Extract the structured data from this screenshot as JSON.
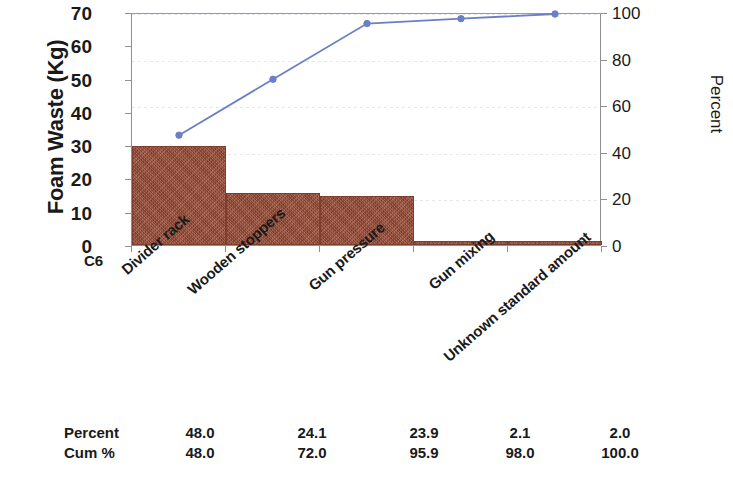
{
  "chart_data": {
    "type": "bar",
    "title": "",
    "subtitle": "",
    "categories": [
      "Divider rack",
      "Wooden stoppers",
      "Gun pressure",
      "Gun mixing",
      "Unknown standard amount"
    ],
    "series": [
      {
        "name": "Foam Waste (Kg)",
        "type": "bar",
        "values": [
          29.8,
          15.5,
          14.8,
          1.3,
          1.2
        ],
        "axis": "left",
        "color": "#9a4f3a"
      },
      {
        "name": "Cum %",
        "type": "line",
        "values": [
          48.0,
          72.0,
          95.9,
          98.0,
          100.0
        ],
        "axis": "right",
        "color": "#6b7fc7"
      }
    ],
    "xlabel": "C6",
    "ylabel": "Foam Waste (Kg)",
    "y2label": "Percent",
    "ylim": [
      0,
      70
    ],
    "y2lim": [
      0,
      100
    ],
    "yticks": [
      "0",
      "10",
      "20",
      "30",
      "40",
      "50",
      "60",
      "70"
    ],
    "ytick_values": [
      0,
      10,
      20,
      30,
      40,
      50,
      60,
      70
    ],
    "y2ticks": [
      "0",
      "20",
      "40",
      "60",
      "80",
      "100"
    ],
    "y2tick_values": [
      0,
      20,
      40,
      60,
      80,
      100
    ],
    "grid": true,
    "legend": "none"
  },
  "axes": {
    "left_title": "Foam Waste (Kg)",
    "right_title": "Percent",
    "x_variable_label": "C6"
  },
  "table": {
    "rows": [
      {
        "header": "Percent",
        "values": [
          "48.0",
          "24.1",
          "23.9",
          "2.1",
          "2.0"
        ]
      },
      {
        "header": "Cum %",
        "values": [
          "48.0",
          "72.0",
          "95.9",
          "98.0",
          "100.0"
        ]
      }
    ]
  },
  "colors": {
    "bar": "#9a4f3a",
    "bar_border": "#7d3e2d",
    "line": "#6b7fc7",
    "axis": "#8f8f8f",
    "grid": "#e2e2ea",
    "text": "#1a1a1a"
  }
}
